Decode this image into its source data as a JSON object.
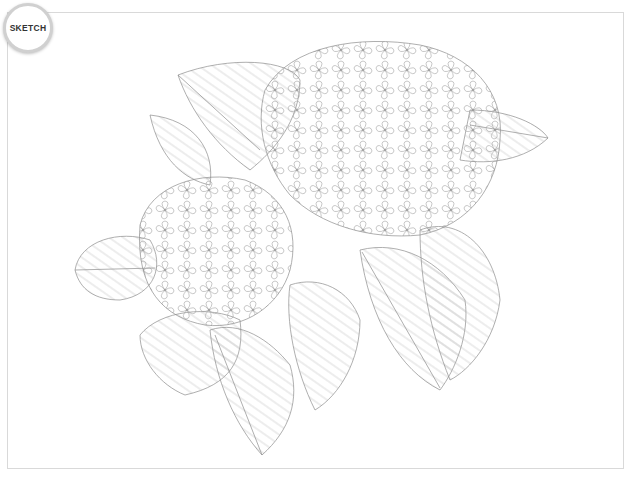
{
  "badge": {
    "label": "SKETCH"
  },
  "artwork": {
    "subject": "Hydrangea pencil sketch",
    "line_color": "#8a8a8a",
    "frame_color": "#d9d9d9"
  },
  "caption": {
    "text": ""
  }
}
